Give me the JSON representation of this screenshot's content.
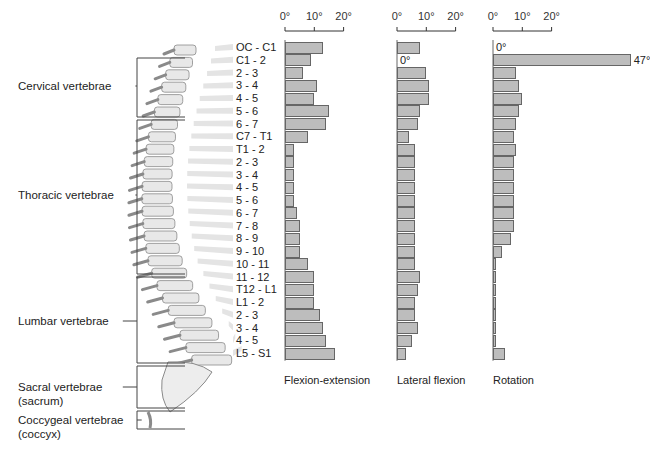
{
  "regions": [
    {
      "label": "Cervical vertebrae",
      "label_y": 86,
      "top": 58,
      "bottom": 117
    },
    {
      "label": "Thoracic vertebrae",
      "label_y": 195,
      "top": 120,
      "bottom": 274
    },
    {
      "label": "Lumbar vertebrae",
      "label_y": 321,
      "top": 277,
      "bottom": 363
    },
    {
      "label": "Sacral vertebrae",
      "label2": "(sacrum)",
      "label_y": 387,
      "top": 366,
      "bottom": 408
    },
    {
      "label": "Coccygeal vertebrae",
      "label2": "(coccyx)",
      "label_y": 420,
      "top": 411,
      "bottom": 429
    }
  ],
  "segments": [
    "OC - C1",
    "C1 - 2",
    "2 - 3",
    "3 - 4",
    "4 - 5",
    "5 - 6",
    "6 - 7",
    "C7 - T1",
    "T1 - 2",
    "2 - 3",
    "3 - 4",
    "4 - 5",
    "5 - 6",
    "6 - 7",
    "7 - 8",
    "8 - 9",
    "9 - 10",
    "10 - 11",
    "11 - 12",
    "T12 - L1",
    "L1 - 2",
    "2 - 3",
    "3 - 4",
    "4 - 5",
    "L5 - S1"
  ],
  "axis_ticks": [
    "0°",
    "10°",
    "20°"
  ],
  "chart_data": [
    {
      "type": "bar",
      "orientation": "horizontal",
      "title": "Flexion-extension",
      "xlabel": "Flexion-extension",
      "ylabel": "Spinal segment",
      "xlim": [
        0,
        20
      ],
      "x_ticks": [
        "0°",
        "10°",
        "20°"
      ],
      "categories": [
        "OC - C1",
        "C1 - 2",
        "2 - 3",
        "3 - 4",
        "4 - 5",
        "5 - 6",
        "6 - 7",
        "C7 - T1",
        "T1 - 2",
        "2 - 3",
        "3 - 4",
        "4 - 5",
        "5 - 6",
        "6 - 7",
        "7 - 8",
        "8 - 9",
        "9 - 10",
        "10 - 11",
        "11 - 12",
        "T12 - L1",
        "L1 - 2",
        "2 - 3",
        "3 - 4",
        "4 - 5",
        "L5 - S1"
      ],
      "values": [
        13,
        9,
        6,
        11,
        10,
        15,
        14,
        8,
        3,
        3,
        3,
        3,
        3,
        4,
        5,
        5,
        5,
        8,
        10,
        10,
        10,
        12,
        13,
        14,
        17
      ],
      "units": "degrees",
      "grid": false
    },
    {
      "type": "bar",
      "orientation": "horizontal",
      "title": "Lateral flexion",
      "xlabel": "Lateral flexion",
      "xlim": [
        0,
        20
      ],
      "x_ticks": [
        "0°",
        "10°",
        "20°"
      ],
      "categories": [
        "OC - C1",
        "C1 - 2",
        "2 - 3",
        "3 - 4",
        "4 - 5",
        "5 - 6",
        "6 - 7",
        "C7 - T1",
        "T1 - 2",
        "2 - 3",
        "3 - 4",
        "4 - 5",
        "5 - 6",
        "6 - 7",
        "7 - 8",
        "8 - 9",
        "9 - 10",
        "10 - 11",
        "11 - 12",
        "T12 - L1",
        "L1 - 2",
        "2 - 3",
        "3 - 4",
        "4 - 5",
        "L5 - S1"
      ],
      "values": [
        8,
        0,
        10,
        11,
        11,
        8,
        7,
        4,
        6,
        6,
        6,
        6,
        6,
        6,
        6,
        6,
        6,
        6,
        8,
        7,
        6,
        6,
        7,
        5,
        3
      ],
      "annotations": [
        {
          "category": "C1 - 2",
          "text": "0°"
        }
      ],
      "units": "degrees",
      "grid": false
    },
    {
      "type": "bar",
      "orientation": "horizontal",
      "title": "Rotation",
      "xlabel": "Rotation",
      "xlim": [
        0,
        20
      ],
      "x_ticks": [
        "0°",
        "10°",
        "20°"
      ],
      "categories": [
        "OC - C1",
        "C1 - 2",
        "2 - 3",
        "3 - 4",
        "4 - 5",
        "5 - 6",
        "6 - 7",
        "C7 - T1",
        "T1 - 2",
        "2 - 3",
        "3 - 4",
        "4 - 5",
        "5 - 6",
        "6 - 7",
        "7 - 8",
        "8 - 9",
        "9 - 10",
        "10 - 11",
        "11 - 12",
        "T12 - L1",
        "L1 - 2",
        "2 - 3",
        "3 - 4",
        "4 - 5",
        "L5 - S1"
      ],
      "values": [
        0,
        47,
        8,
        9,
        10,
        9,
        8,
        7,
        8,
        7,
        7,
        7,
        7,
        7,
        7,
        6,
        3,
        1,
        1,
        1,
        1,
        1,
        1,
        1,
        4
      ],
      "annotations": [
        {
          "category": "OC - C1",
          "text": "0°"
        },
        {
          "category": "C1 - 2",
          "text": "47°"
        }
      ],
      "units": "degrees",
      "grid": false
    }
  ],
  "chart_layout": {
    "x0": [
      285,
      397,
      493
    ],
    "px_per_deg": 2.93,
    "row_top": 41,
    "row_h": 12.75
  }
}
